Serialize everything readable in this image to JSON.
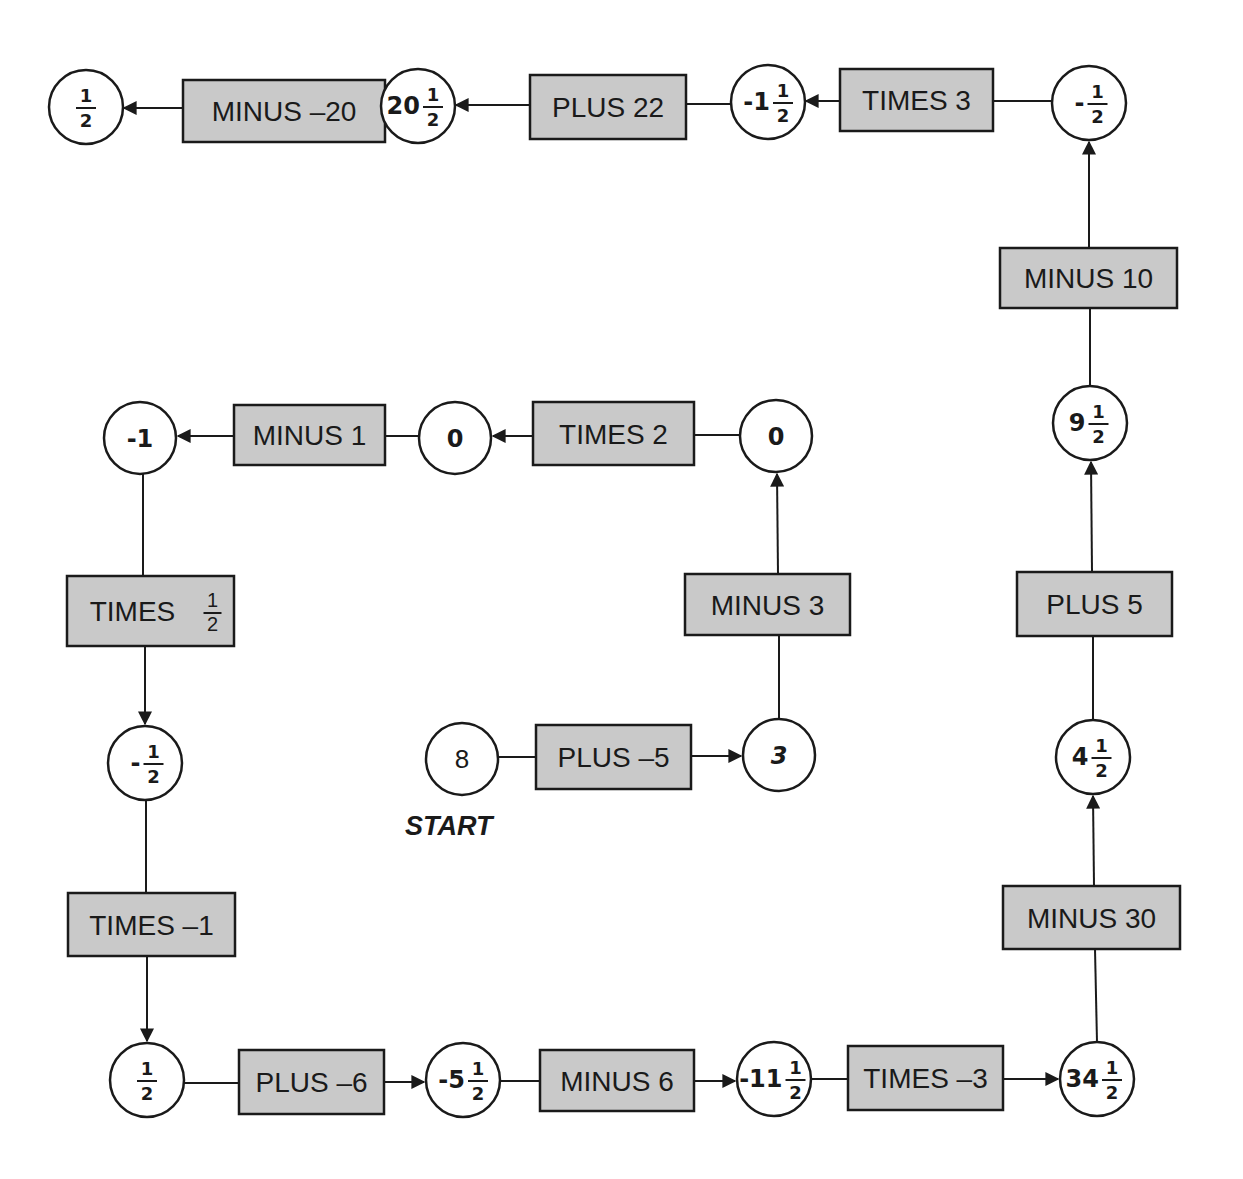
{
  "diagram": {
    "start_label": "START",
    "colors": {
      "box_fill": "#c9c9c9",
      "stroke": "#1a1a1a",
      "node_fill": "#ffffff",
      "background": "#ffffff"
    },
    "nodes": [
      {
        "id": "n_start",
        "whole": "8",
        "num": "",
        "den": "",
        "sign": "",
        "style": "plain",
        "cx": 462,
        "cy": 759,
        "r": 36
      },
      {
        "id": "n_3",
        "whole": "3",
        "num": "",
        "den": "",
        "sign": "",
        "style": "italic",
        "cx": 779,
        "cy": 755,
        "r": 36
      },
      {
        "id": "n_0a",
        "whole": "0",
        "num": "",
        "den": "",
        "sign": "",
        "style": "bold",
        "cx": 776,
        "cy": 436,
        "r": 36
      },
      {
        "id": "n_0b",
        "whole": "0",
        "num": "",
        "den": "",
        "sign": "",
        "style": "bold",
        "cx": 455,
        "cy": 438,
        "r": 36
      },
      {
        "id": "n_neg1",
        "whole": "-1",
        "num": "",
        "den": "",
        "sign": "",
        "style": "bold",
        "cx": 140,
        "cy": 438,
        "r": 36
      },
      {
        "id": "n_neg_half",
        "whole": "",
        "num": "1",
        "den": "2",
        "sign": "-",
        "style": "bold",
        "cx": 145,
        "cy": 763,
        "r": 37
      },
      {
        "id": "n_half_bl",
        "whole": "",
        "num": "1",
        "den": "2",
        "sign": "",
        "style": "bold",
        "cx": 147,
        "cy": 1080,
        "r": 37
      },
      {
        "id": "n_neg5half",
        "whole": "-5",
        "num": "1",
        "den": "2",
        "sign": "",
        "style": "bold",
        "cx": 463,
        "cy": 1080,
        "r": 37
      },
      {
        "id": "n_neg11half",
        "whole": "-11",
        "num": "1",
        "den": "2",
        "sign": "",
        "style": "bold",
        "cx": 774,
        "cy": 1079,
        "r": 37
      },
      {
        "id": "n_34half",
        "whole": "34",
        "num": "1",
        "den": "2",
        "sign": "",
        "style": "bold",
        "cx": 1097,
        "cy": 1079,
        "r": 37
      },
      {
        "id": "n_4half",
        "whole": "4",
        "num": "1",
        "den": "2",
        "sign": "",
        "style": "bold",
        "cx": 1093,
        "cy": 757,
        "r": 37
      },
      {
        "id": "n_9half",
        "whole": "9",
        "num": "1",
        "den": "2",
        "sign": "",
        "style": "bold",
        "cx": 1090,
        "cy": 423,
        "r": 37
      },
      {
        "id": "n_neg_half_tr",
        "whole": "",
        "num": "1",
        "den": "2",
        "sign": "-",
        "style": "bold",
        "cx": 1089,
        "cy": 103,
        "r": 37
      },
      {
        "id": "n_neg1half",
        "whole": "-1",
        "num": "1",
        "den": "2",
        "sign": "",
        "style": "bold",
        "cx": 768,
        "cy": 102,
        "r": 37
      },
      {
        "id": "n_20half",
        "whole": "20",
        "num": "1",
        "den": "2",
        "sign": "",
        "style": "bold",
        "cx": 418,
        "cy": 106,
        "r": 37
      },
      {
        "id": "n_half_tl",
        "whole": "",
        "num": "1",
        "den": "2",
        "sign": "",
        "style": "bold",
        "cx": 86,
        "cy": 107,
        "r": 37
      }
    ],
    "operations": [
      {
        "id": "op_plus_neg5",
        "label": "PLUS –5",
        "frac_num": "",
        "frac_den": "",
        "x": 536,
        "y": 725,
        "w": 155,
        "h": 64
      },
      {
        "id": "op_minus_3",
        "label": "MINUS 3",
        "frac_num": "",
        "frac_den": "",
        "x": 685,
        "y": 574,
        "w": 165,
        "h": 61
      },
      {
        "id": "op_times_2",
        "label": "TIMES 2",
        "frac_num": "",
        "frac_den": "",
        "x": 533,
        "y": 402,
        "w": 161,
        "h": 63
      },
      {
        "id": "op_minus_1",
        "label": "MINUS 1",
        "frac_num": "",
        "frac_den": "",
        "x": 234,
        "y": 405,
        "w": 151,
        "h": 60
      },
      {
        "id": "op_times_half",
        "label": "TIMES",
        "frac_num": "1",
        "frac_den": "2",
        "x": 67,
        "y": 576,
        "w": 167,
        "h": 70
      },
      {
        "id": "op_times_neg1",
        "label": "TIMES –1",
        "frac_num": "",
        "frac_den": "",
        "x": 68,
        "y": 893,
        "w": 167,
        "h": 63
      },
      {
        "id": "op_plus_neg6",
        "label": "PLUS –6",
        "frac_num": "",
        "frac_den": "",
        "x": 239,
        "y": 1050,
        "w": 145,
        "h": 64
      },
      {
        "id": "op_minus_6",
        "label": "MINUS 6",
        "frac_num": "",
        "frac_den": "",
        "x": 540,
        "y": 1050,
        "w": 154,
        "h": 61
      },
      {
        "id": "op_times_neg3",
        "label": "TIMES –3",
        "frac_num": "",
        "frac_den": "",
        "x": 848,
        "y": 1046,
        "w": 155,
        "h": 64
      },
      {
        "id": "op_minus_30",
        "label": "MINUS 30",
        "frac_num": "",
        "frac_den": "",
        "x": 1003,
        "y": 886,
        "w": 177,
        "h": 63
      },
      {
        "id": "op_plus_5",
        "label": "PLUS 5",
        "frac_num": "",
        "frac_den": "",
        "x": 1017,
        "y": 572,
        "w": 155,
        "h": 64
      },
      {
        "id": "op_minus_10",
        "label": "MINUS 10",
        "frac_num": "",
        "frac_den": "",
        "x": 1000,
        "y": 248,
        "w": 177,
        "h": 60
      },
      {
        "id": "op_times_3",
        "label": "TIMES 3",
        "frac_num": "",
        "frac_den": "",
        "x": 840,
        "y": 69,
        "w": 153,
        "h": 62
      },
      {
        "id": "op_plus_22",
        "label": "PLUS 22",
        "frac_num": "",
        "frac_den": "",
        "x": 530,
        "y": 75,
        "w": 156,
        "h": 64
      },
      {
        "id": "op_minus_neg20",
        "label": "MINUS –20",
        "frac_num": "",
        "frac_den": "",
        "x": 183,
        "y": 80,
        "w": 202,
        "h": 62
      }
    ],
    "sequence": [
      "8",
      "PLUS –5",
      "3",
      "MINUS 3",
      "0",
      "TIMES 2",
      "0",
      "MINUS 1",
      "-1",
      "TIMES 1/2",
      "-1/2",
      "TIMES –1",
      "1/2",
      "PLUS –6",
      "-5 1/2",
      "MINUS 6",
      "-11 1/2",
      "TIMES –3",
      "34 1/2",
      "MINUS 30",
      "4 1/2",
      "PLUS 5",
      "9 1/2",
      "MINUS 10",
      "-1/2",
      "TIMES 3",
      "-1 1/2",
      "PLUS 22",
      "20 1/2",
      "MINUS –20",
      "1/2"
    ]
  }
}
